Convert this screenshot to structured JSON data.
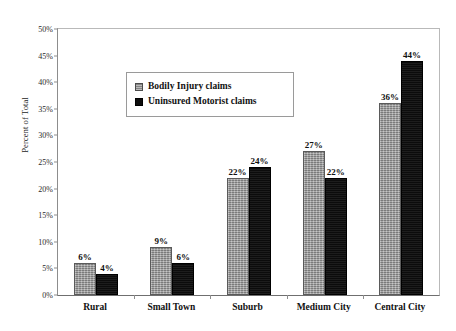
{
  "chart_data": {
    "type": "bar",
    "title": "",
    "subtitle": "",
    "xlabel": "",
    "ylabel": "Percent of Total",
    "ylim": [
      0,
      50
    ],
    "ytick_labels": [
      "0%",
      "5%",
      "10%",
      "15%",
      "20%",
      "25%",
      "30%",
      "35%",
      "40%",
      "45%",
      "50%"
    ],
    "ytick_values": [
      0,
      5,
      10,
      15,
      20,
      25,
      30,
      35,
      40,
      45,
      50
    ],
    "grid": false,
    "legend_position": "upper-left-inside",
    "categories": [
      "Rural",
      "Small Town",
      "Suburb",
      "Medium City",
      "Central City"
    ],
    "series": [
      {
        "name": "Bodily Injury claims",
        "color": "#9c9c9c",
        "values": [
          6,
          9,
          22,
          27,
          36
        ],
        "value_labels": [
          "6%",
          "9%",
          "22%",
          "27%",
          "36%"
        ]
      },
      {
        "name": "Uninsured Motorist claims",
        "color": "#111111",
        "values": [
          4,
          6,
          24,
          22,
          44
        ],
        "value_labels": [
          "4%",
          "6%",
          "24%",
          "22%",
          "44%"
        ]
      }
    ]
  }
}
